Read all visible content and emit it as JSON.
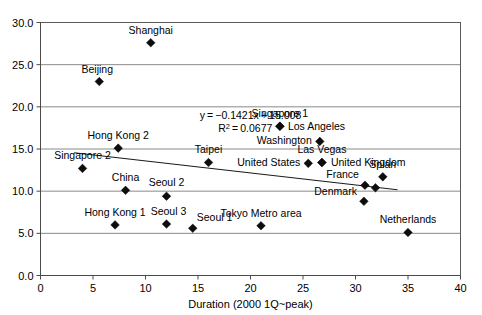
{
  "chart_data": {
    "type": "scatter",
    "title": "",
    "xlabel": "Duration (2000 1Q~peak)",
    "ylabel": "",
    "xlim": [
      0,
      40
    ],
    "ylim": [
      0,
      30
    ],
    "xticks": [
      "0",
      "5",
      "10",
      "15",
      "20",
      "25",
      "30",
      "35",
      "40"
    ],
    "xtick_values": [
      0,
      5,
      10,
      15,
      20,
      25,
      30,
      35,
      40
    ],
    "yticks": [
      "0.0",
      "5.0",
      "10.0",
      "15.0",
      "20.0",
      "25.0",
      "30.0"
    ],
    "ytick_values": [
      0,
      5,
      10,
      15,
      20,
      25,
      30
    ],
    "grid": "horizontal",
    "legend": "none",
    "points": [
      {
        "label": "Shanghai",
        "x": 10.5,
        "y": 27.6,
        "label_dx": 0,
        "label_dy": -9,
        "label_anchor": "middle"
      },
      {
        "label": "Beijing",
        "x": 5.6,
        "y": 23.0,
        "label_dx": -2,
        "label_dy": -9,
        "label_anchor": "middle"
      },
      {
        "label": "Singapore 1",
        "x": 22.8,
        "y": 17.7,
        "label_dx": 0,
        "label_dy": -9,
        "label_anchor": "middle"
      },
      {
        "label": "Los Angeles",
        "x": 22.8,
        "y": 17.7,
        "label_dx": 8,
        "label_dy": 4,
        "label_anchor": "start"
      },
      {
        "label": "Washington",
        "x": 26.6,
        "y": 15.9,
        "label_dx": -8,
        "label_dy": 3,
        "label_anchor": "end"
      },
      {
        "label": "Hong Kong 2",
        "x": 7.4,
        "y": 15.1,
        "label_dx": 0,
        "label_dy": -9,
        "label_anchor": "middle"
      },
      {
        "label": "Taipei",
        "x": 16.0,
        "y": 13.4,
        "label_dx": 0,
        "label_dy": -9,
        "label_anchor": "middle"
      },
      {
        "label": "Las Vegas",
        "x": 26.8,
        "y": 13.4,
        "label_dx": 0,
        "label_dy": -9,
        "label_anchor": "middle"
      },
      {
        "label": "United States",
        "x": 25.5,
        "y": 13.3,
        "label_dx": -8,
        "label_dy": 3,
        "label_anchor": "end"
      },
      {
        "label": "United Kingdom",
        "x": 26.8,
        "y": 13.4,
        "label_dx": 9,
        "label_dy": 4,
        "label_anchor": "start"
      },
      {
        "label": "Singapore 2",
        "x": 4.0,
        "y": 12.7,
        "label_dx": 0,
        "label_dy": -9,
        "label_anchor": "middle"
      },
      {
        "label": "Spian",
        "x": 32.6,
        "y": 11.7,
        "label_dx": 0,
        "label_dy": -9,
        "label_anchor": "middle"
      },
      {
        "label": "France",
        "x": 30.9,
        "y": 10.7,
        "label_dx": -6,
        "label_dy": -7,
        "label_anchor": "end"
      },
      {
        "label": "United Kingdom 2",
        "x": 31.9,
        "y": 10.4,
        "label_dx": 0,
        "label_dy": 0,
        "label_anchor": "middle",
        "hide_label": true
      },
      {
        "label": "China",
        "x": 8.1,
        "y": 10.1,
        "label_dx": 0,
        "label_dy": -9,
        "label_anchor": "middle"
      },
      {
        "label": "Seoul 2",
        "x": 12.0,
        "y": 9.4,
        "label_dx": 0,
        "label_dy": -10,
        "label_anchor": "middle"
      },
      {
        "label": "Denmark",
        "x": 30.8,
        "y": 8.8,
        "label_dx": -7,
        "label_dy": -6,
        "label_anchor": "end"
      },
      {
        "label": "Seoul 3",
        "x": 12.0,
        "y": 6.1,
        "label_dx": 2,
        "label_dy": -9,
        "label_anchor": "middle"
      },
      {
        "label": "Hong Kong 1",
        "x": 7.1,
        "y": 6.0,
        "label_dx": 0,
        "label_dy": -9,
        "label_anchor": "middle"
      },
      {
        "label": "Tokyo Metro area",
        "x": 21.0,
        "y": 5.9,
        "label_dx": 0,
        "label_dy": -9,
        "label_anchor": "middle"
      },
      {
        "label": "Seoul 1",
        "x": 14.5,
        "y": 5.6,
        "label_dx": 4,
        "label_dy": -7,
        "label_anchor": "start"
      },
      {
        "label": "Netherlands",
        "x": 35.0,
        "y": 5.1,
        "label_dx": 0,
        "label_dy": -9,
        "label_anchor": "middle"
      }
    ],
    "trendline": {
      "slope": -0.1421,
      "intercept": 15.008,
      "x_start": 3.2,
      "x_end": 34.0,
      "equation": "y = −0.1421x + 15.008",
      "equation_prefix": "y = −0.1421x + 15.008",
      "r2_label": "R",
      "r2_sup": "2",
      "r2_value": " = 0.0677",
      "eq_x": 20.0,
      "eq_y": 18.6,
      "r2_x": 19.5,
      "r2_y": 17.0
    },
    "colors": {
      "marker": "#0d0d0d",
      "gridline": "#8a8a8a",
      "frame": "#5a5a5a",
      "trendline": "#1a1a1a",
      "background": "#ffffff",
      "text": "#000000"
    }
  }
}
